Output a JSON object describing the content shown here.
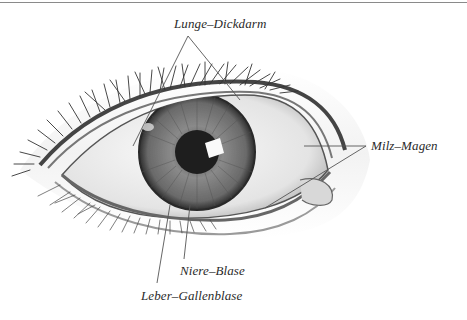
{
  "figure": {
    "type": "iris-diagram",
    "labels": [
      {
        "id": "lunge",
        "text": "Lunge–Dickdarm",
        "x": 174,
        "y": 16
      },
      {
        "id": "milz",
        "text": "Milz–Magen",
        "x": 371,
        "y": 138
      },
      {
        "id": "niere",
        "text": "Niere–Blase",
        "x": 180,
        "y": 263
      },
      {
        "id": "leber",
        "text": "Leber–Gallenblase",
        "x": 141,
        "y": 288
      }
    ],
    "leader_lines": {
      "lunge": [
        [
          188,
          36,
          133,
          146
        ],
        [
          188,
          36,
          240,
          100
        ]
      ],
      "milz": [
        [
          366,
          146,
          304,
          146
        ],
        [
          366,
          146,
          265,
          208
        ]
      ],
      "niere": [
        [
          184,
          259,
          190,
          205
        ]
      ],
      "leber": [
        [
          157,
          283,
          170,
          205
        ]
      ]
    },
    "colors": {
      "ink": "#2a2a2a",
      "line": "#555555",
      "iris": "#6e6e6e",
      "pupil": "#1e1e1e",
      "sclera": "#f2f2f2",
      "skin": "#e6e6e6"
    }
  }
}
